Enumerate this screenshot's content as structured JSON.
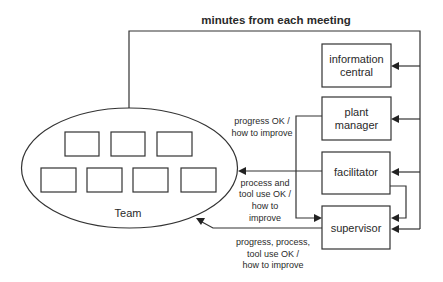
{
  "diagram": {
    "title": "minutes from each meeting",
    "team": {
      "label": "Team",
      "member_count_top_row": 3,
      "member_count_bottom_row": 4
    },
    "nodes": {
      "information_central": {
        "line1": "information",
        "line2": "central"
      },
      "plant_manager": {
        "line1": "plant",
        "line2": "manager"
      },
      "facilitator": {
        "line1": "facilitator"
      },
      "supervisor": {
        "line1": "supervisor"
      }
    },
    "edge_labels": {
      "plant_manager_feedback": {
        "line1": "progress OK /",
        "line2": "how to improve"
      },
      "facilitator_feedback": {
        "line1": "process and",
        "line2": "tool use OK /",
        "line3": "how to",
        "line4": "improve"
      },
      "supervisor_feedback": {
        "line1": "progress, process,",
        "line2": "tool use OK /",
        "line3": "how to improve"
      }
    },
    "colors": {
      "stroke": "#333333",
      "text": "#2a2a2a",
      "background": "#ffffff"
    }
  }
}
